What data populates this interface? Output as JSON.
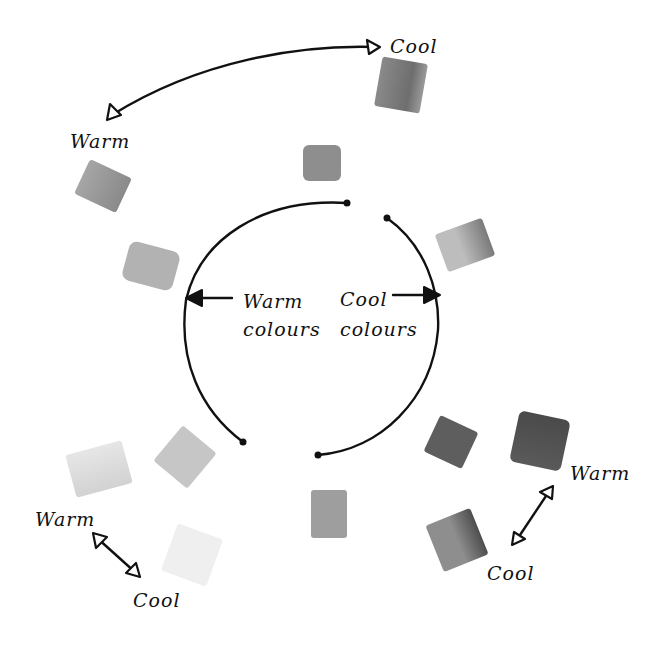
{
  "diagram": {
    "type": "colour-wheel-temperature",
    "center_labels": {
      "warm": [
        "Warm",
        "colours"
      ],
      "cool": [
        "Cool",
        "colours"
      ]
    },
    "labels": {
      "top_cool": "Cool",
      "top_warm": "Warm",
      "bottom_left_warm": "Warm",
      "bottom_left_cool": "Cool",
      "bottom_right_warm": "Warm",
      "bottom_right_cool": "Cool"
    },
    "swatches": [
      {
        "id": "top-right-cool",
        "x": 378,
        "y": 60,
        "w": 46,
        "h": 50,
        "rotate": 10,
        "color": "#7c7c7c"
      },
      {
        "id": "top",
        "x": 303,
        "y": 145,
        "w": 38,
        "h": 36,
        "rotate": 0,
        "color": "#8e8e8e"
      },
      {
        "id": "upper-left-warm",
        "x": 80,
        "y": 167,
        "w": 46,
        "h": 38,
        "rotate": 25,
        "color": "#9a9a9a"
      },
      {
        "id": "left",
        "x": 125,
        "y": 246,
        "w": 52,
        "h": 40,
        "rotate": 15,
        "color": "#b0b0b0"
      },
      {
        "id": "right-upper",
        "x": 440,
        "y": 225,
        "w": 50,
        "h": 40,
        "rotate": -20,
        "color": "#a8a8a8"
      },
      {
        "id": "bottom-left-inner",
        "x": 163,
        "y": 434,
        "w": 44,
        "h": 46,
        "rotate": 40,
        "color": "#c4c4c4"
      },
      {
        "id": "bottom-left-warm",
        "x": 70,
        "y": 447,
        "w": 58,
        "h": 44,
        "rotate": -15,
        "color": "#e2e2e2"
      },
      {
        "id": "bottom-left-cool",
        "x": 168,
        "y": 530,
        "w": 48,
        "h": 50,
        "rotate": 20,
        "color": "#ededed"
      },
      {
        "id": "bottom",
        "x": 311,
        "y": 490,
        "w": 36,
        "h": 48,
        "rotate": 0,
        "color": "#9c9c9c"
      },
      {
        "id": "bottom-right-inner",
        "x": 430,
        "y": 422,
        "w": 42,
        "h": 40,
        "rotate": 25,
        "color": "#5e5e5e"
      },
      {
        "id": "bottom-right-warm",
        "x": 514,
        "y": 415,
        "w": 52,
        "h": 52,
        "rotate": 12,
        "color": "#4e4e4e"
      },
      {
        "id": "bottom-right-cool",
        "x": 433,
        "y": 515,
        "w": 48,
        "h": 50,
        "rotate": -22,
        "color": "#7a7a7a"
      }
    ],
    "ink_color": "#111111"
  }
}
